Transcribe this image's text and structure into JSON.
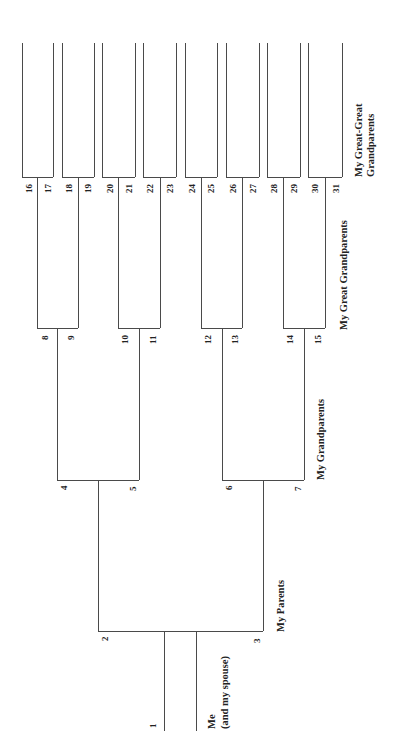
{
  "diagram": {
    "orientation": "rotated-90",
    "line_color": "#4a4a4a",
    "generation_labels": {
      "me_line1": "Me",
      "me_line2": "(and my spouse)",
      "parents": "My Parents",
      "grandparents": "My Grandparents",
      "great_grandparents": "My Great Grandparents",
      "great_great_line1": "My Great-Great",
      "great_great_line2": "Grandparents"
    },
    "nodes": {
      "n1": "1",
      "n2": "2",
      "n3": "3",
      "n4": "4",
      "n5": "5",
      "n6": "6",
      "n7": "7",
      "n8": "8",
      "n9": "9",
      "n10": "10",
      "n11": "11",
      "n12": "12",
      "n13": "13",
      "n14": "14",
      "n15": "15",
      "n16": "16",
      "n17": "17",
      "n18": "18",
      "n19": "19",
      "n20": "20",
      "n21": "21",
      "n22": "22",
      "n23": "23",
      "n24": "24",
      "n25": "25",
      "n26": "26",
      "n27": "27",
      "n28": "28",
      "n29": "29",
      "n30": "30",
      "n31": "31"
    },
    "generations": [
      {
        "label": "Me (and my spouse)",
        "numbers": [
          "1"
        ]
      },
      {
        "label": "My Parents",
        "numbers": [
          "2",
          "3"
        ]
      },
      {
        "label": "My Grandparents",
        "numbers": [
          "4",
          "5",
          "6",
          "7"
        ]
      },
      {
        "label": "My Great Grandparents",
        "numbers": [
          "8",
          "9",
          "10",
          "11",
          "12",
          "13",
          "14",
          "15"
        ]
      },
      {
        "label": "My Great-Great Grandparents",
        "numbers": [
          "16",
          "17",
          "18",
          "19",
          "20",
          "21",
          "22",
          "23",
          "24",
          "25",
          "26",
          "27",
          "28",
          "29",
          "30",
          "31"
        ]
      }
    ]
  }
}
